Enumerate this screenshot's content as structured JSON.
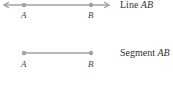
{
  "diagram": {
    "stroke_color": "#a0a0a0",
    "line": {
      "caption_prefix": "Line ",
      "caption_name": "AB",
      "point_a": "A",
      "point_b": "B",
      "arrows": "both"
    },
    "segment": {
      "caption_prefix": "Segment ",
      "caption_name": "AB",
      "point_a": "A",
      "point_b": "B",
      "endpoints": "dots"
    }
  }
}
